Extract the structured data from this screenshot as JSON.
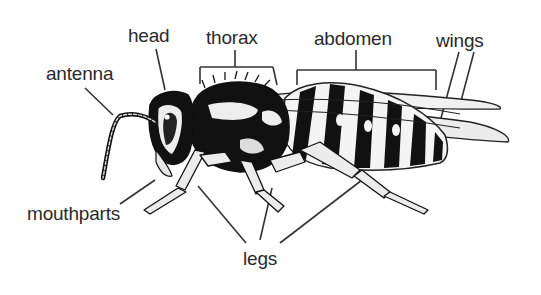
{
  "diagram": {
    "labels": {
      "head": "head",
      "thorax": "thorax",
      "abdomen": "abdomen",
      "wings": "wings",
      "antenna": "antenna",
      "mouthparts": "mouthparts",
      "legs": "legs"
    }
  }
}
